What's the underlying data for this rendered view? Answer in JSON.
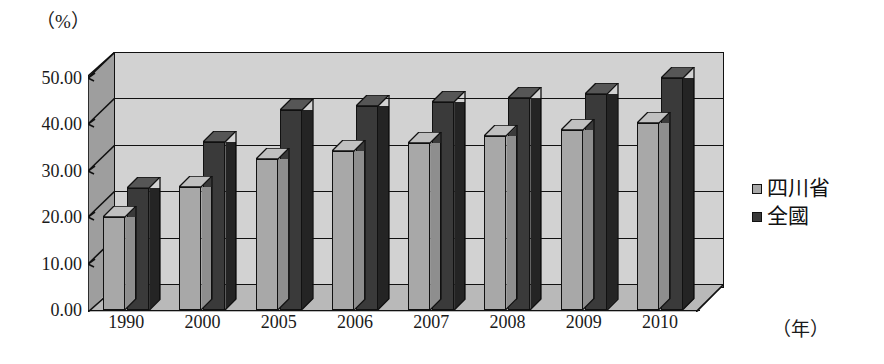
{
  "chart_data": {
    "type": "bar",
    "title": "",
    "subtitle": "",
    "xlabel": "（年）",
    "ylabel": "（%）",
    "categories": [
      "1990",
      "2000",
      "2005",
      "2006",
      "2007",
      "2008",
      "2009",
      "2010"
    ],
    "series": [
      {
        "name": "四川省",
        "color": "#a8a8a8",
        "values": [
          20.0,
          26.5,
          32.5,
          34.3,
          36.0,
          37.4,
          38.7,
          40.2
        ]
      },
      {
        "name": "全國",
        "color": "#3a3a3a",
        "values": [
          26.4,
          36.2,
          43.0,
          43.9,
          44.9,
          45.7,
          46.6,
          49.9
        ]
      }
    ],
    "ylim": [
      0,
      50
    ],
    "ytick_values": [
      0,
      10,
      20,
      30,
      40,
      50
    ],
    "ytick_labels": [
      "0.00",
      "10.00",
      "20.00",
      "30.00",
      "40.00",
      "50.00"
    ],
    "grid": true,
    "legend_position": "right",
    "style": "3d-column"
  },
  "legend": {
    "entries": [
      {
        "label": "四川省",
        "swatch": "#a8a8a8"
      },
      {
        "label": "全國",
        "swatch": "#3a3a3a"
      }
    ]
  },
  "axis": {
    "y_unit": "（%）",
    "x_unit": "（年）"
  }
}
